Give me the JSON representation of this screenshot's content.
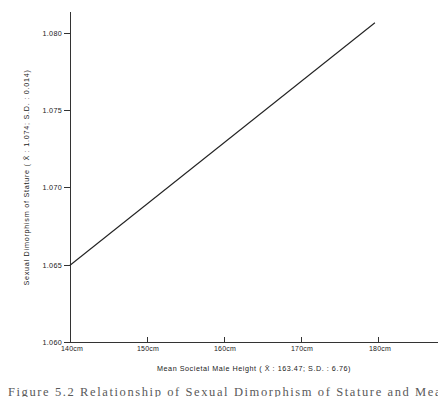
{
  "chart_data": {
    "type": "line",
    "title": "",
    "xlabel": "Mean Societal Male Height   ( X̄ : 163.47; S.D. : 6.76)",
    "ylabel": "Sexual Dimorphism of Stature    ( X̄ : 1.074; S.D. : 0.014)",
    "xlabel_main": "Mean Societal Male Height",
    "xlabel_stats": "( X̄ : 163.47; S.D. : 6.76)",
    "ylabel_main": "Sexual Dimorphism of Stature",
    "ylabel_stats": "( X̄ : 1.074; S.D. : 0.014)",
    "x_mean": "163.47",
    "x_sd": "6.76",
    "y_mean": "1.074",
    "y_sd": "0.014",
    "xlim": [
      140,
      180
    ],
    "ylim": [
      1.06,
      1.0815
    ],
    "grid": false,
    "legend": "none",
    "xticks": [
      140,
      150,
      160,
      170,
      180
    ],
    "xticklabels": [
      "140cm",
      "150cm",
      "160cm",
      "170cm",
      "180cm"
    ],
    "yticks": [
      1.06,
      1.065,
      1.07,
      1.075,
      1.08
    ],
    "yticklabels": [
      "1.060",
      "1.065",
      "1.070",
      "1.075",
      "1.080"
    ],
    "series": [
      {
        "name": "regression-line",
        "x": [
          140,
          179.6
        ],
        "values": [
          1.065,
          1.0808
        ],
        "color": "#222222"
      }
    ],
    "line_start": {
      "x": 140,
      "y": 1.065
    },
    "line_end": {
      "x": 179.6,
      "y": 1.0808
    }
  },
  "axes": {
    "y_tick_0": "1.080",
    "y_tick_1": "1.075",
    "y_tick_2": "1.070",
    "y_tick_3": "1.065",
    "y_tick_4": "1.060",
    "x_tick_0": "140cm",
    "x_tick_1": "150cm",
    "x_tick_2": "160cm",
    "x_tick_3": "170cm",
    "x_tick_4": "180cm"
  },
  "caption": {
    "text": "Figure 5.2   Relationship of Sexual Dimorphism of Stature and Mean"
  }
}
